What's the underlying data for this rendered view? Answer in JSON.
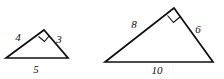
{
  "figure": {
    "stroke_color": "#101010",
    "background_color": "#ffffff",
    "shapes": [
      {
        "name": "small-triangle",
        "right_angle_vertex": "apex",
        "vertices": {
          "left": [
            6,
            58
          ],
          "apex": [
            44,
            30
          ],
          "right": [
            68,
            58
          ]
        },
        "labels": {
          "left_leg": "4",
          "right_leg": "3",
          "base": "5"
        },
        "label_positions": {
          "left_leg": [
            18,
            38
          ],
          "right_leg": [
            59,
            40
          ],
          "base": [
            36,
            70
          ]
        },
        "right_angle_marker": [
          [
            38.5,
            36.5
          ],
          [
            44.5,
            41.5
          ],
          [
            49.5,
            35.5
          ],
          [
            44,
            30.5
          ]
        ]
      },
      {
        "name": "large-triangle",
        "right_angle_vertex": "apex",
        "vertices": {
          "left": [
            105,
            62
          ],
          "apex": [
            174,
            8
          ],
          "right": [
            213,
            62
          ]
        },
        "labels": {
          "left_leg": "8",
          "right_leg": "6",
          "base": "10"
        },
        "label_positions": {
          "left_leg": [
            134,
            25
          ],
          "right_leg": [
            198,
            30
          ],
          "base": [
            157,
            71
          ]
        },
        "right_angle_marker": [
          [
            167.5,
            15.5
          ],
          [
            173.5,
            22.5
          ],
          [
            180.5,
            16.5
          ],
          [
            174,
            8.5
          ]
        ]
      }
    ]
  }
}
